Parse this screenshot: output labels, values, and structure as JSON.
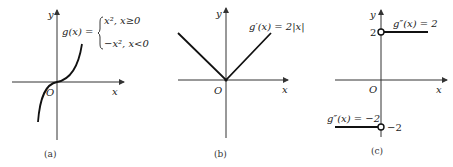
{
  "panels": [
    {
      "id": "a",
      "caption": "(a)",
      "axis_x_label": "x",
      "axis_y_label": "y",
      "origin_label": "O",
      "function_name": "g(x) =",
      "piece_1": "x², x≥0",
      "piece_2": "−x², x<0",
      "description": "graph of g(x) = x|x|, an odd S-shaped curve through the origin"
    },
    {
      "id": "b",
      "caption": "(b)",
      "axis_x_label": "x",
      "axis_y_label": "y",
      "origin_label": "O",
      "function_label": "g′(x) = 2|x|",
      "description": "V-shaped graph with vertex at origin"
    },
    {
      "id": "c",
      "caption": "(c)",
      "axis_x_label": "x",
      "axis_y_label": "y",
      "origin_label": "O",
      "upper_label": "g″(x) = 2",
      "lower_label": "g″(x) = −2",
      "upper_tick": "2",
      "lower_tick": "−2",
      "description": "step function, open circles at (0,2) and (0,−2)"
    }
  ],
  "colors": {
    "ink": "#111111",
    "axis": "#333333",
    "background": "#ffffff"
  }
}
